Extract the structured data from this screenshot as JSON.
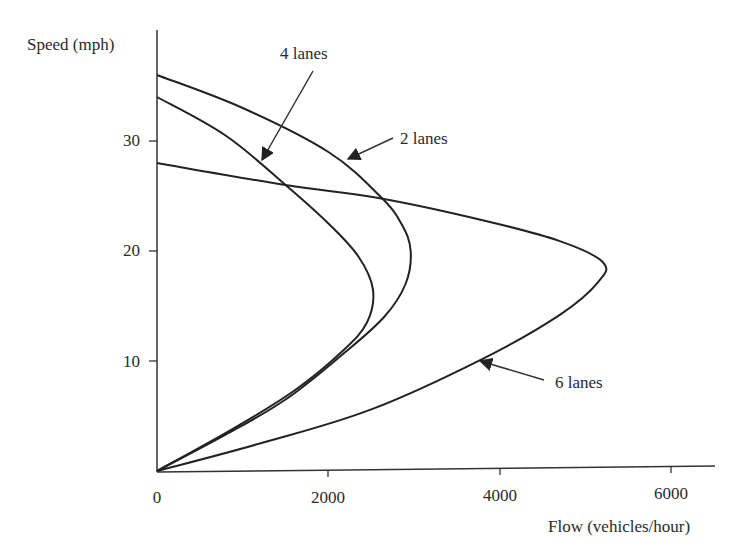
{
  "chart_data": {
    "type": "line",
    "title": "",
    "xlabel": "Flow (vehicles/hour)",
    "ylabel": "Speed (mph)",
    "xlim": [
      0,
      6500
    ],
    "ylim": [
      0,
      40
    ],
    "x_ticks": [
      0,
      2000,
      4000,
      6000
    ],
    "y_ticks": [
      10,
      20,
      30
    ],
    "grid": false,
    "legend": "none (inline arrow annotations)",
    "series": [
      {
        "name": "2 lanes",
        "points": [
          [
            0,
            36
          ],
          [
            1000,
            33
          ],
          [
            2000,
            29
          ],
          [
            2600,
            25
          ],
          [
            2850,
            22.5
          ],
          [
            2960,
            20
          ],
          [
            2900,
            17
          ],
          [
            2650,
            14
          ],
          [
            2150,
            10.5
          ],
          [
            1500,
            6.5
          ],
          [
            800,
            3.3
          ],
          [
            0,
            0
          ]
        ]
      },
      {
        "name": "4 lanes",
        "points": [
          [
            0,
            34
          ],
          [
            800,
            30.5
          ],
          [
            1500,
            26
          ],
          [
            2000,
            22.5
          ],
          [
            2350,
            19.5
          ],
          [
            2520,
            16.5
          ],
          [
            2450,
            13.5
          ],
          [
            2150,
            10.8
          ],
          [
            1600,
            7.3
          ],
          [
            900,
            3.9
          ],
          [
            0,
            0
          ]
        ]
      },
      {
        "name": "6 lanes",
        "points": [
          [
            0,
            28
          ],
          [
            1500,
            26
          ],
          [
            2600,
            24.8
          ],
          [
            3800,
            22.8
          ],
          [
            4700,
            20.9
          ],
          [
            5200,
            19
          ],
          [
            5150,
            17.2
          ],
          [
            4700,
            14.2
          ],
          [
            3800,
            10.2
          ],
          [
            2500,
            5.6
          ],
          [
            1200,
            2.5
          ],
          [
            0,
            0
          ]
        ]
      }
    ],
    "annotations": [
      {
        "text": "4 lanes",
        "label_at": [
          1750,
          38.5
        ],
        "arrow_to": [
          1250,
          28
        ]
      },
      {
        "text": "2 lanes",
        "label_at": [
          3600,
          30.5
        ],
        "arrow_to": [
          2250,
          28.5
        ]
      },
      {
        "text": "6 lanes",
        "label_at": [
          4600,
          9.5
        ],
        "arrow_to": [
          3800,
          10.5
        ]
      }
    ]
  },
  "axes": {
    "y_label": "Speed (mph)",
    "x_label": "Flow (vehicles/hour)",
    "y_tick_labels": [
      "30",
      "20",
      "10"
    ],
    "x_tick_labels": [
      "0",
      "2000",
      "4000",
      "6000"
    ]
  },
  "annotations": {
    "four_lanes": "4 lanes",
    "two_lanes": "2 lanes",
    "six_lanes": "6 lanes"
  },
  "colors": {
    "line": "#222222",
    "axis": "#333333",
    "background": "#ffffff"
  }
}
